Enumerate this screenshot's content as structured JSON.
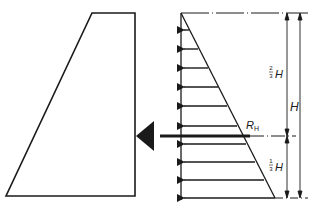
{
  "diagram": {
    "colors": {
      "stroke": "#1a1a1a",
      "background": "#ffffff"
    },
    "dam": {
      "shape": "trapezoid",
      "points": [
        [
          92,
          13
        ],
        [
          135,
          13
        ],
        [
          135,
          196
        ],
        [
          6,
          196
        ]
      ]
    },
    "pressure_triangle": {
      "top": [
        181,
        13
      ],
      "bottom_left": [
        181,
        198
      ],
      "bottom_right": [
        275,
        198
      ],
      "arrow_rows_y": [
        30,
        49,
        68,
        87,
        106,
        126,
        144,
        162,
        180,
        198
      ]
    },
    "resultant": {
      "label": "R",
      "subscript": "H",
      "y": 136,
      "x_from": 245,
      "x_to": 135
    },
    "dimensions": {
      "upper_label_num": "2",
      "upper_label_den": "3",
      "upper_label_var": "H",
      "total_label": "H",
      "lower_label_num": "1",
      "lower_label_den": "3",
      "lower_label_var": "H"
    }
  }
}
